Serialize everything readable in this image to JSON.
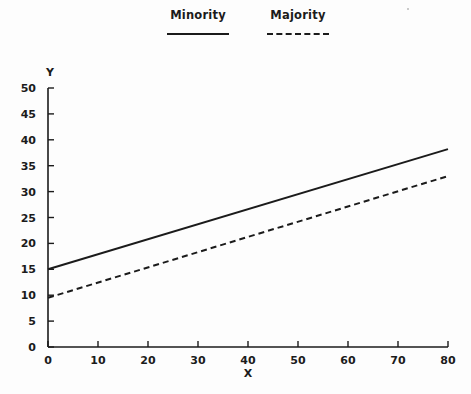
{
  "chart_data": {
    "type": "line",
    "title": "",
    "xlabel": "X",
    "ylabel": "Y",
    "xlim": [
      0,
      80
    ],
    "ylim": [
      0,
      50
    ],
    "xticks": [
      0,
      10,
      20,
      30,
      40,
      50,
      60,
      70,
      80
    ],
    "yticks": [
      0,
      5,
      10,
      15,
      20,
      25,
      30,
      35,
      40,
      45,
      50
    ],
    "grid": false,
    "legend_position": "top-center",
    "series": [
      {
        "name": "Minority",
        "style": "solid",
        "color": "#1b1b1b",
        "x": [
          0,
          80
        ],
        "values": [
          15.0,
          38.2
        ]
      },
      {
        "name": "Majority",
        "style": "dashed",
        "color": "#1b1b1b",
        "x": [
          0,
          80
        ],
        "values": [
          9.5,
          33.0
        ]
      }
    ]
  },
  "legend": {
    "entries": [
      {
        "label": "Minority",
        "style": "solid"
      },
      {
        "label": "Majority",
        "style": "dashed"
      }
    ]
  },
  "axes": {
    "x_title": "X",
    "y_title": "Y",
    "x_tick_labels": [
      "0",
      "10",
      "20",
      "30",
      "40",
      "50",
      "60",
      "70",
      "80"
    ],
    "y_tick_labels": [
      "0",
      "5",
      "10",
      "15",
      "20",
      "25",
      "30",
      "35",
      "40",
      "45",
      "50"
    ]
  }
}
